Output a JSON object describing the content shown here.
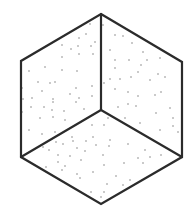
{
  "diagram": {
    "type": "isometric-cube-stippled",
    "background": "#ffffff",
    "stroke_color": "#2b2b2b",
    "stroke_width": 2.2,
    "dot_color": "#7a7a7a",
    "dot_radius": 0.75,
    "vertices": {
      "top": [
        101,
        14
      ],
      "upper_left": [
        21,
        61
      ],
      "lower_left": [
        21,
        157
      ],
      "bottom": [
        101,
        204
      ],
      "lower_right": [
        182,
        157
      ],
      "upper_right": [
        182,
        62
      ],
      "center": [
        101,
        110
      ]
    },
    "faces": [
      {
        "name": "left-face",
        "points": "top,upper_left,lower_left,center"
      },
      {
        "name": "right-face",
        "points": "top,upper_right,lower_right,center"
      },
      {
        "name": "bottom-face",
        "points": "center,lower_left,bottom,lower_right"
      }
    ],
    "dots": {
      "left_face": [
        [
          90,
          24
        ],
        [
          86,
          34
        ],
        [
          79,
          38
        ],
        [
          62,
          45
        ],
        [
          78,
          46
        ],
        [
          71,
          49
        ],
        [
          95,
          42
        ],
        [
          91,
          46
        ],
        [
          62,
          57
        ],
        [
          79,
          54
        ],
        [
          93,
          54
        ],
        [
          62,
          70
        ],
        [
          77,
          71
        ],
        [
          45,
          67
        ],
        [
          29,
          71
        ],
        [
          38,
          82
        ],
        [
          50,
          83
        ],
        [
          55,
          82
        ],
        [
          42,
          91
        ],
        [
          76,
          88
        ],
        [
          92,
          86
        ],
        [
          70,
          94
        ],
        [
          22,
          88
        ],
        [
          53,
          99
        ],
        [
          79,
          98
        ],
        [
          92,
          96
        ],
        [
          23,
          99
        ],
        [
          31,
          107
        ],
        [
          44,
          107
        ],
        [
          53,
          102
        ],
        [
          40,
          118
        ],
        [
          53,
          117
        ],
        [
          64,
          111
        ],
        [
          76,
          102
        ],
        [
          22,
          112
        ],
        [
          29,
          130
        ],
        [
          42,
          134
        ],
        [
          65,
          120
        ],
        [
          52,
          110
        ],
        [
          32,
          98
        ],
        [
          55,
          132
        ],
        [
          84,
          109
        ]
      ],
      "right_face": [
        [
          115,
          35
        ],
        [
          123,
          36
        ],
        [
          132,
          43
        ],
        [
          110,
          50
        ],
        [
          143,
          52
        ],
        [
          115,
          60
        ],
        [
          129,
          60
        ],
        [
          141,
          65
        ],
        [
          147,
          60
        ],
        [
          160,
          58
        ],
        [
          115,
          68
        ],
        [
          138,
          72
        ],
        [
          158,
          74
        ],
        [
          110,
          79
        ],
        [
          120,
          79
        ],
        [
          131,
          77
        ],
        [
          150,
          80
        ],
        [
          165,
          77
        ],
        [
          104,
          83
        ],
        [
          115,
          89
        ],
        [
          128,
          92
        ],
        [
          138,
          96
        ],
        [
          155,
          95
        ],
        [
          161,
          92
        ],
        [
          118,
          107
        ],
        [
          128,
          104
        ],
        [
          136,
          106
        ],
        [
          170,
          108
        ],
        [
          140,
          123
        ],
        [
          156,
          113
        ],
        [
          113,
          117
        ],
        [
          125,
          118
        ],
        [
          160,
          130
        ],
        [
          173,
          118
        ],
        [
          173,
          126
        ],
        [
          178,
          132
        ],
        [
          103,
          25
        ]
      ],
      "bottom_face": [
        [
          108,
          118
        ],
        [
          104,
          125
        ],
        [
          92,
          125
        ],
        [
          72,
          137
        ],
        [
          93,
          137
        ],
        [
          86,
          141
        ],
        [
          110,
          140
        ],
        [
          56,
          142
        ],
        [
          73,
          141
        ],
        [
          63,
          144
        ],
        [
          96,
          145
        ],
        [
          77,
          148
        ],
        [
          43,
          147
        ],
        [
          58,
          155
        ],
        [
          70,
          156
        ],
        [
          49,
          150
        ],
        [
          109,
          146
        ],
        [
          128,
          144
        ],
        [
          145,
          150
        ],
        [
          161,
          155
        ],
        [
          150,
          157
        ],
        [
          138,
          158
        ],
        [
          103,
          155
        ],
        [
          85,
          151
        ],
        [
          81,
          160
        ],
        [
          65,
          166
        ],
        [
          46,
          167
        ],
        [
          58,
          162
        ],
        [
          104,
          165
        ],
        [
          124,
          163
        ],
        [
          143,
          163
        ],
        [
          80,
          178
        ],
        [
          93,
          172
        ],
        [
          116,
          176
        ],
        [
          130,
          180
        ],
        [
          107,
          184
        ],
        [
          91,
          192
        ],
        [
          101,
          197
        ],
        [
          123,
          185
        ],
        [
          104,
          192
        ],
        [
          77,
          174
        ],
        [
          62,
          170
        ]
      ]
    }
  }
}
